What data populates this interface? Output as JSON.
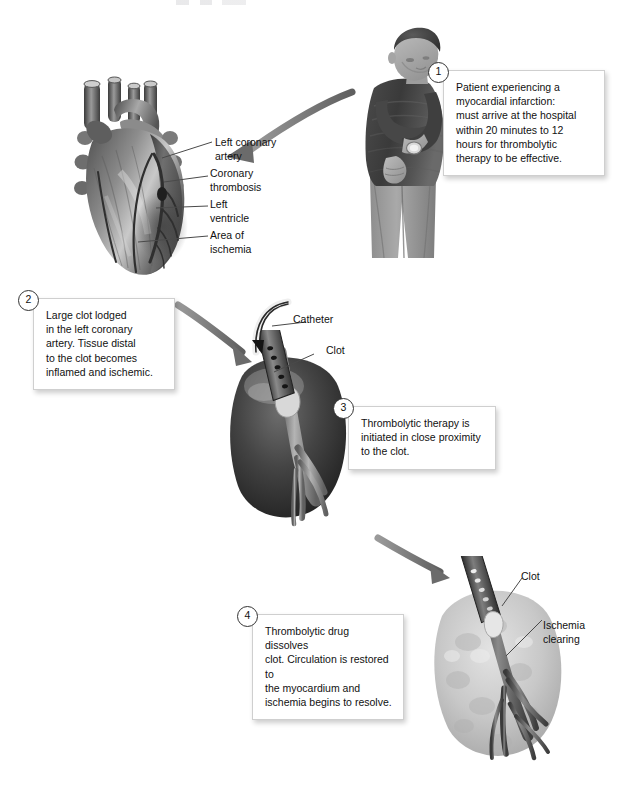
{
  "page": {
    "background": "#ffffff",
    "ink": "#1a1a1a",
    "arrow_color": "#6e6e6e",
    "leader_color": "#4a4a4a"
  },
  "steps": [
    {
      "number": "1",
      "text": "Patient experiencing a\nmyocardial infarction:\nmust arrive at the hospital\nwithin 20 minutes to 12\nhours for thrombolytic\ntherapy to be effective."
    },
    {
      "number": "2",
      "text": "Large clot lodged\nin the left coronary\nartery. Tissue distal\nto the clot becomes\ninflamed and ischemic."
    },
    {
      "number": "3",
      "text": "Thrombolytic therapy is\ninitiated in close proximity\nto the clot."
    },
    {
      "number": "4",
      "text": "Thrombolytic drug dissolves\nclot. Circulation is restored to\nthe myocardium and\nischemia begins to resolve."
    }
  ],
  "labels": {
    "heart": [
      {
        "text": "Left coronary\nartery"
      },
      {
        "text": "Coronary\nthrombosis"
      },
      {
        "text": "Left\nventricle"
      },
      {
        "text": "Area of\nischemia"
      }
    ],
    "middle": [
      {
        "text": "Catheter"
      },
      {
        "text": "Clot"
      }
    ],
    "bottom": [
      {
        "text": "Clot"
      },
      {
        "text": "Ischemia\nclearing"
      }
    ]
  },
  "figures": {
    "patient": "man-clutching-chest-illustration",
    "heart": "anatomical-heart-illustration",
    "middle_myocardium": "ischemic-myocardium-with-catheter-illustration",
    "bottom_myocardium": "reperfused-myocardium-illustration"
  },
  "arrows": [
    {
      "name": "patient-to-heart"
    },
    {
      "name": "heart-to-middle"
    },
    {
      "name": "middle-to-bottom"
    },
    {
      "name": "catheter-insertion"
    }
  ]
}
